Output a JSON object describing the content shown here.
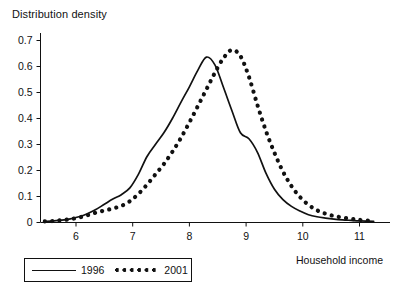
{
  "chart_data": {
    "type": "line",
    "title": "",
    "xlabel": "Household income",
    "ylabel": "Distribution density",
    "xlim": [
      5.3,
      11.45
    ],
    "ylim": [
      0,
      0.72
    ],
    "xticks": [
      6,
      7,
      8,
      9,
      10,
      11
    ],
    "xticklabels": [
      "6",
      "7",
      "8",
      "9",
      "10",
      "11"
    ],
    "yticks": [
      0,
      0.1,
      0.2,
      0.3,
      0.4,
      0.5,
      0.6,
      0.7
    ],
    "yticklabels": [
      "0",
      "0.1",
      "0.2",
      "0.3",
      "0.4",
      "0.5",
      "0.6",
      "0.7"
    ],
    "grid": false,
    "legend_position": "below-left",
    "x": [
      5.45,
      5.6,
      5.75,
      5.9,
      6.05,
      6.2,
      6.35,
      6.5,
      6.65,
      6.8,
      6.95,
      7.1,
      7.25,
      7.4,
      7.55,
      7.7,
      7.85,
      8.0,
      8.15,
      8.3,
      8.45,
      8.6,
      8.75,
      8.9,
      9.05,
      9.2,
      9.35,
      9.5,
      9.65,
      9.8,
      9.95,
      10.1,
      10.25,
      10.4,
      10.55,
      10.7,
      10.85,
      11.0,
      11.25
    ],
    "series": [
      {
        "name": "1996",
        "style": "solid",
        "color": "#111111",
        "peak_x": 8.28,
        "peak_y": 0.638,
        "values": [
          0.004,
          0.006,
          0.009,
          0.014,
          0.022,
          0.034,
          0.05,
          0.07,
          0.09,
          0.107,
          0.133,
          0.185,
          0.253,
          0.3,
          0.345,
          0.4,
          0.462,
          0.522,
          0.586,
          0.636,
          0.606,
          0.52,
          0.43,
          0.345,
          0.322,
          0.27,
          0.19,
          0.128,
          0.088,
          0.062,
          0.044,
          0.03,
          0.022,
          0.017,
          0.013,
          0.01,
          0.008,
          0.006,
          0.004
        ]
      },
      {
        "name": "2001",
        "style": "dotted",
        "color": "#111111",
        "peak_x": 8.72,
        "peak_y": 0.665,
        "values": [
          0.004,
          0.006,
          0.009,
          0.013,
          0.019,
          0.028,
          0.038,
          0.046,
          0.054,
          0.064,
          0.082,
          0.11,
          0.145,
          0.185,
          0.225,
          0.272,
          0.325,
          0.385,
          0.448,
          0.512,
          0.576,
          0.632,
          0.664,
          0.64,
          0.56,
          0.452,
          0.352,
          0.268,
          0.196,
          0.14,
          0.098,
          0.068,
          0.047,
          0.034,
          0.025,
          0.019,
          0.014,
          0.01,
          0.006
        ]
      }
    ],
    "legend": [
      {
        "label": "1996",
        "style": "solid"
      },
      {
        "label": "2001",
        "style": "dotted"
      }
    ]
  }
}
